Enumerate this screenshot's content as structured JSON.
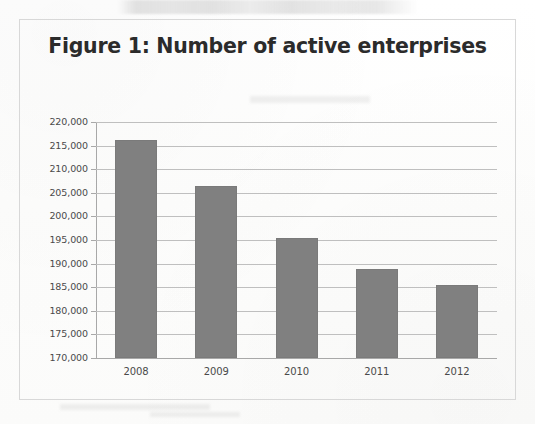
{
  "figure": {
    "title": "Figure 1: Number of active enterprises",
    "frame_color": "#d8d8d8",
    "background_color": "#fdfdfc"
  },
  "chart_data": {
    "type": "bar",
    "title": "Figure 1: Number of active enterprises",
    "xlabel": "",
    "ylabel": "",
    "categories": [
      "2008",
      "2009",
      "2010",
      "2011",
      "2012"
    ],
    "values": [
      216200,
      206500,
      195400,
      188800,
      185400
    ],
    "series": [
      {
        "name": "Number of active enterprises",
        "values": [
          216200,
          206500,
          195400,
          188800,
          185400
        ]
      }
    ],
    "ylim": [
      170000,
      220000
    ],
    "ytick_step": 5000,
    "ytick_labels": [
      "220,000",
      "215,000",
      "210,000",
      "205,000",
      "200,000",
      "195,000",
      "190,000",
      "185,000",
      "180,000",
      "175,000",
      "170,000"
    ],
    "ytick_values": [
      220000,
      215000,
      210000,
      205000,
      200000,
      195000,
      190000,
      185000,
      180000,
      175000,
      170000
    ],
    "grid": true,
    "grid_axis": "y",
    "legend": false,
    "legend_position": "none",
    "bar_color": "#808080",
    "gridline_color": "#bfbfbf",
    "axis_color": "#a8a8a8",
    "annotations": []
  }
}
